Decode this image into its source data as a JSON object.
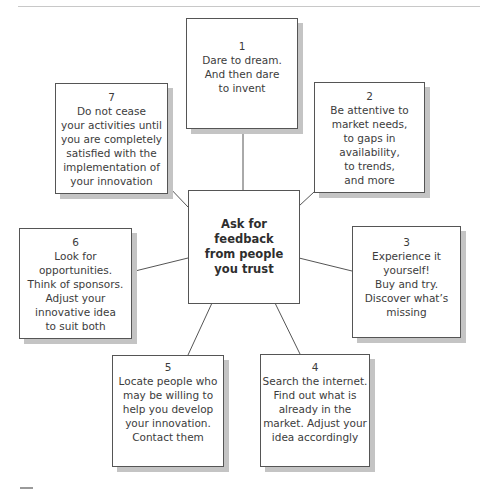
{
  "diagram": {
    "type": "hub-and-spoke",
    "center": {
      "lines": [
        "Ask for",
        "feedback",
        "from people",
        "you trust"
      ]
    },
    "boxes": [
      {
        "number": "1",
        "lines": [
          "Dare to dream.",
          "And then dare",
          "to invent"
        ]
      },
      {
        "number": "2",
        "lines": [
          "Be attentive to",
          "market needs,",
          "to gaps in",
          "availability,",
          "to trends,",
          "and more"
        ]
      },
      {
        "number": "3",
        "lines": [
          "Experience it",
          "yourself!",
          "Buy and try.",
          "Discover what’s",
          "missing"
        ]
      },
      {
        "number": "4",
        "lines": [
          "Search the internet.",
          "Find out what is",
          "already in the",
          "market. Adjust your",
          "idea accordingly"
        ]
      },
      {
        "number": "5",
        "lines": [
          "Locate people who",
          "may be willing to",
          "help you develop",
          "your innovation.",
          "Contact them"
        ]
      },
      {
        "number": "6",
        "lines": [
          "Look for",
          "opportunities.",
          "Think of sponsors.",
          "Adjust your",
          "innovative idea",
          "to suit both"
        ]
      },
      {
        "number": "7",
        "lines": [
          "Do not cease",
          "your activities until",
          "you are completely",
          "satisfied with the",
          "implementation of",
          "your innovation"
        ]
      }
    ]
  },
  "colors": {
    "border": "#555555",
    "shadow": "#c4c4c4",
    "text": "#3c3c3c",
    "background": "#ffffff"
  }
}
